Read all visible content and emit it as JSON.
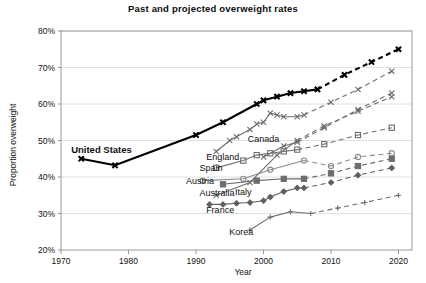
{
  "chart_data": {
    "type": "line",
    "title": "Past and projected overweight rates",
    "xlabel": "Year",
    "ylabel": "Proportion overweight",
    "xlim": [
      1970,
      2022
    ],
    "ylim": [
      20,
      80
    ],
    "xticks": [
      1970,
      1980,
      1990,
      2000,
      2010,
      2020
    ],
    "xtick_labels": [
      "1970",
      "1980",
      "1990",
      "2000",
      "2010",
      "2020"
    ],
    "yticks": [
      20,
      30,
      40,
      50,
      60,
      70,
      80
    ],
    "ytick_labels": [
      "20%",
      "30%",
      "40%",
      "50%",
      "60%",
      "70%",
      "80%"
    ],
    "grid": "horizontal",
    "legend": "inline-labels",
    "note": "Solid segments are observed history; dashed segments are projections.",
    "series": [
      {
        "name": "United States",
        "label": "United States",
        "marker": "x",
        "color": "#000000",
        "emphasis": "bold",
        "label_x": 1971.5,
        "label_y": 47.5,
        "label_anchor": "start",
        "history": [
          {
            "x": 1973,
            "y": 45.0
          },
          {
            "x": 1978,
            "y": 43.2
          },
          {
            "x": 1990,
            "y": 51.5
          },
          {
            "x": 1994,
            "y": 55.0
          },
          {
            "x": 1999,
            "y": 60.0
          },
          {
            "x": 2000,
            "y": 61.0
          },
          {
            "x": 2002,
            "y": 62.0
          },
          {
            "x": 2004,
            "y": 63.0
          },
          {
            "x": 2006,
            "y": 63.5
          },
          {
            "x": 2008,
            "y": 64.0
          }
        ],
        "projection": [
          {
            "x": 2008,
            "y": 64.0
          },
          {
            "x": 2012,
            "y": 68.0
          },
          {
            "x": 2016,
            "y": 71.5
          },
          {
            "x": 2020,
            "y": 75.0
          }
        ]
      },
      {
        "name": "England",
        "label": "England",
        "marker": "x",
        "color": "#6d6d6d",
        "emphasis": "normal",
        "label_x": 1991.5,
        "label_y": 45.5,
        "label_anchor": "start",
        "history": [
          {
            "x": 1993,
            "y": 47.0
          },
          {
            "x": 1995,
            "y": 50.0
          },
          {
            "x": 1996,
            "y": 51.0
          },
          {
            "x": 1998,
            "y": 53.0
          },
          {
            "x": 1999,
            "y": 54.5
          },
          {
            "x": 2000,
            "y": 55.0
          },
          {
            "x": 2001,
            "y": 57.5
          },
          {
            "x": 2002,
            "y": 57.0
          },
          {
            "x": 2003,
            "y": 56.5
          },
          {
            "x": 2005,
            "y": 56.5
          },
          {
            "x": 2006,
            "y": 57.0
          }
        ],
        "projection": [
          {
            "x": 2006,
            "y": 57.0
          },
          {
            "x": 2010,
            "y": 60.5
          },
          {
            "x": 2014,
            "y": 64.0
          },
          {
            "x": 2019,
            "y": 69.0
          }
        ]
      },
      {
        "name": "Canada",
        "label": "Canada",
        "marker": "x",
        "color": "#6d6d6d",
        "emphasis": "normal",
        "label_x": 2000.0,
        "label_y": 50.5,
        "label_anchor": "middle",
        "history": [
          {
            "x": 2000,
            "y": 45.5
          },
          {
            "x": 2003,
            "y": 48.5
          },
          {
            "x": 2005,
            "y": 49.5
          }
        ],
        "projection": [
          {
            "x": 2005,
            "y": 49.5
          },
          {
            "x": 2009,
            "y": 53.5
          },
          {
            "x": 2014,
            "y": 58.5
          },
          {
            "x": 2019,
            "y": 63.0
          }
        ]
      },
      {
        "name": "Spain",
        "label": "Spain",
        "marker": "square",
        "color": "#6d6d6d",
        "emphasis": "normal",
        "label_x": 1990.5,
        "label_y": 42.5,
        "label_anchor": "start",
        "history": [
          {
            "x": 1993,
            "y": 42.5
          },
          {
            "x": 1997,
            "y": 44.5
          },
          {
            "x": 1999,
            "y": 46.0
          },
          {
            "x": 2001,
            "y": 46.5
          },
          {
            "x": 2003,
            "y": 47.0
          },
          {
            "x": 2005,
            "y": 47.5
          }
        ],
        "projection": [
          {
            "x": 2005,
            "y": 47.5
          },
          {
            "x": 2009,
            "y": 49.0
          },
          {
            "x": 2014,
            "y": 51.5
          },
          {
            "x": 2019,
            "y": 53.5
          }
        ]
      },
      {
        "name": "Austria",
        "label": "Austria",
        "marker": "circle-open",
        "color": "#8a8a8a",
        "emphasis": "normal",
        "label_x": 1988.5,
        "label_y": 39.0,
        "label_anchor": "start",
        "history": [
          {
            "x": 1991,
            "y": 39.0
          },
          {
            "x": 1997,
            "y": 39.5
          },
          {
            "x": 2001,
            "y": 42.0
          },
          {
            "x": 2006,
            "y": 44.5
          }
        ],
        "projection": [
          {
            "x": 2006,
            "y": 44.5
          },
          {
            "x": 2010,
            "y": 43.0
          },
          {
            "x": 2014,
            "y": 45.5
          },
          {
            "x": 2019,
            "y": 46.5
          }
        ]
      },
      {
        "name": "Australia",
        "label": "Australia",
        "marker": "x",
        "color": "#6d6d6d",
        "emphasis": "normal",
        "label_x": 1990.5,
        "label_y": 35.5,
        "label_anchor": "start",
        "history": [
          {
            "x": 1993,
            "y": 35.0
          },
          {
            "x": 1998,
            "y": 38.5
          },
          {
            "x": 2002,
            "y": 46.0
          },
          {
            "x": 2005,
            "y": 50.0
          }
        ],
        "projection": [
          {
            "x": 2005,
            "y": 50.0
          },
          {
            "x": 2009,
            "y": 54.0
          },
          {
            "x": 2014,
            "y": 58.0
          },
          {
            "x": 2019,
            "y": 62.0
          }
        ]
      },
      {
        "name": "Italy",
        "label": "Italy",
        "marker": "square-filled",
        "color": "#6d6d6d",
        "emphasis": "normal",
        "label_x": 1997.0,
        "label_y": 36.0,
        "label_anchor": "middle",
        "history": [
          {
            "x": 1994,
            "y": 38.0
          },
          {
            "x": 1999,
            "y": 39.0
          },
          {
            "x": 2003,
            "y": 39.5
          },
          {
            "x": 2006,
            "y": 39.5
          }
        ],
        "projection": [
          {
            "x": 2006,
            "y": 39.5
          },
          {
            "x": 2010,
            "y": 41.0
          },
          {
            "x": 2014,
            "y": 43.0
          },
          {
            "x": 2019,
            "y": 45.0
          }
        ]
      },
      {
        "name": "France",
        "label": "France",
        "marker": "diamond",
        "color": "#5f5f5f",
        "emphasis": "normal",
        "label_x": 1991.5,
        "label_y": 31.0,
        "label_anchor": "start",
        "history": [
          {
            "x": 1992,
            "y": 32.5
          },
          {
            "x": 1994,
            "y": 32.5
          },
          {
            "x": 1996,
            "y": 32.8
          },
          {
            "x": 1998,
            "y": 33.0
          },
          {
            "x": 2000,
            "y": 33.5
          },
          {
            "x": 2001,
            "y": 34.5
          },
          {
            "x": 2003,
            "y": 36.0
          },
          {
            "x": 2005,
            "y": 37.0
          },
          {
            "x": 2006,
            "y": 37.0
          }
        ],
        "projection": [
          {
            "x": 2006,
            "y": 37.0
          },
          {
            "x": 2010,
            "y": 38.5
          },
          {
            "x": 2014,
            "y": 40.5
          },
          {
            "x": 2019,
            "y": 42.5
          }
        ]
      },
      {
        "name": "Korea",
        "label": "Korea",
        "marker": "plus",
        "color": "#6d6d6d",
        "emphasis": "normal",
        "label_x": 1998.5,
        "label_y": 25.0,
        "label_anchor": "end",
        "history": [
          {
            "x": 1998,
            "y": 25.5
          },
          {
            "x": 2001,
            "y": 29.0
          },
          {
            "x": 2004,
            "y": 30.5
          },
          {
            "x": 2007,
            "y": 30.0
          }
        ],
        "projection": [
          {
            "x": 2007,
            "y": 30.0
          },
          {
            "x": 2011,
            "y": 31.5
          },
          {
            "x": 2015,
            "y": 33.0
          },
          {
            "x": 2020,
            "y": 35.0
          }
        ]
      }
    ]
  }
}
